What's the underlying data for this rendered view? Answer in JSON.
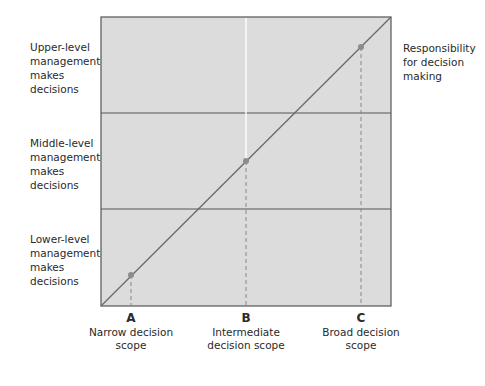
{
  "diagram": {
    "y_levels": [
      {
        "label": "Upper-level management makes decisions"
      },
      {
        "label": "Middle-level management makes decisions"
      },
      {
        "label": "Lower-level management makes decisions"
      }
    ],
    "line_label": "Responsibility for decision making",
    "points": [
      {
        "letter": "A",
        "label": "Narrow decision scope"
      },
      {
        "letter": "B",
        "label": "Intermediate decision scope"
      },
      {
        "letter": "C",
        "label": "Broad decision scope"
      }
    ],
    "colors": {
      "plot_fill": "#dcdcdc",
      "line": "#6a6a6a",
      "point": "#8c8c8c",
      "frame": "#555555"
    }
  }
}
